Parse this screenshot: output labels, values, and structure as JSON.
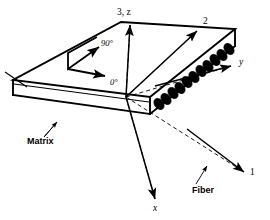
{
  "figure": {
    "background_color": "#ffffff",
    "line_color": "#000000"
  },
  "axes": [
    {
      "id": "axis-3z",
      "label": "3, z",
      "description": "out-of-plane axis pointing up",
      "label_x": 117,
      "label_y": 15,
      "style": "solid"
    },
    {
      "id": "axis-2",
      "label": "2",
      "description": "in-plane transverse material axis pointing upper right",
      "label_x": 203,
      "label_y": 24,
      "style": "dashed-from-origin"
    },
    {
      "id": "axis-y",
      "label": "y",
      "description": "global y axis pointing right",
      "label_x": 239,
      "label_y": 65,
      "style": "dashed-from-origin"
    },
    {
      "id": "axis-1",
      "label": "1",
      "description": "fiber direction material axis pointing lower right",
      "label_x": 250,
      "label_y": 175,
      "style": "dashed-from-origin"
    },
    {
      "id": "axis-x",
      "label": "x",
      "description": "global x axis pointing lower left front",
      "label_x": 153,
      "label_y": 211,
      "style": "dashed-from-origin"
    }
  ],
  "angle_indicator": {
    "ninety_label": "90°",
    "ninety_label_x": 101,
    "ninety_label_y": 46,
    "zero_label": "0°",
    "zero_label_x": 110,
    "zero_label_y": 85
  },
  "part_labels": [
    {
      "id": "matrix",
      "text": "Matrix",
      "x": 27,
      "y": 144,
      "leader_from_x": 57,
      "leader_from_y": 122,
      "leader_to_x": 44,
      "leader_to_y": 136
    },
    {
      "id": "fiber",
      "text": "Fiber",
      "x": 192,
      "y": 193,
      "leader_from_x": 206,
      "leader_from_y": 167,
      "leader_to_x": 196,
      "leader_to_y": 184
    }
  ],
  "slab": {
    "top_face": "235,29 121,22 13,80 150,97",
    "fiber_count": 12,
    "fiber_color": "#000000",
    "face_color": "#ffffff"
  }
}
